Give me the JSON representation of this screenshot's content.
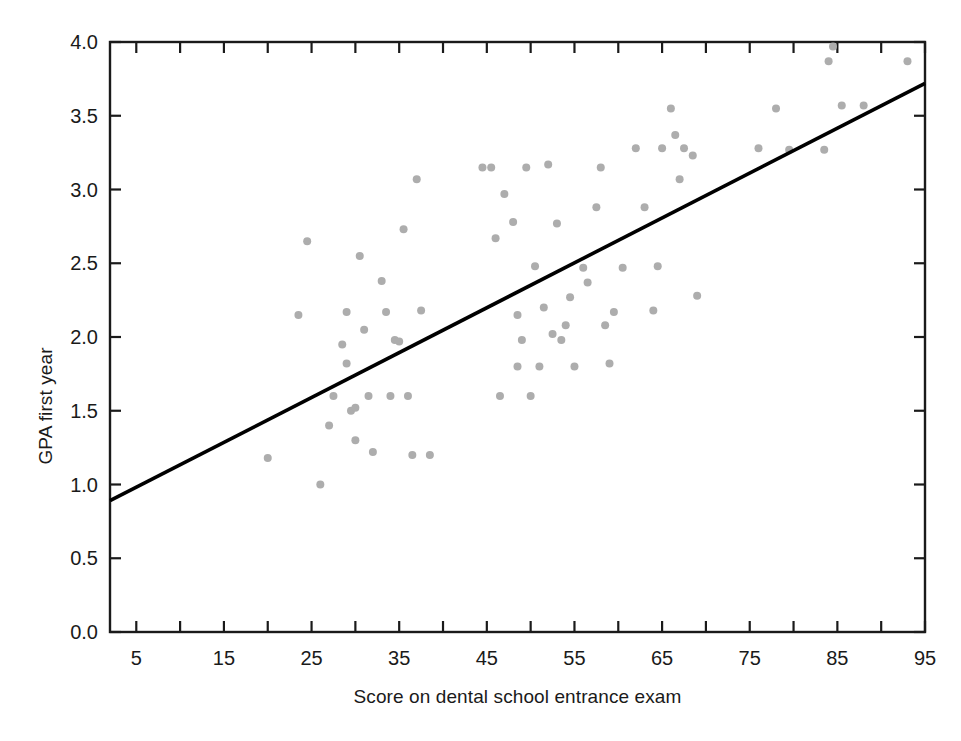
{
  "chart_data": {
    "type": "scatter",
    "title": "",
    "xlabel": "Score on dental school entrance exam",
    "ylabel": "GPA first year",
    "xlim": [
      2,
      95
    ],
    "ylim": [
      0.0,
      4.0
    ],
    "grid": false,
    "legend": "none",
    "point_color": "#adadad",
    "line_color": "#000000",
    "axis_color": "#1a1a1a",
    "xticks_major": [
      5,
      15,
      25,
      35,
      45,
      55,
      65,
      75,
      85,
      95
    ],
    "xticks_minor": [
      10,
      20,
      30,
      40,
      50,
      60,
      70,
      80,
      90
    ],
    "xtick_labels": [
      "5",
      "15",
      "25",
      "35",
      "45",
      "55",
      "65",
      "75",
      "85",
      "95"
    ],
    "yticks": [
      0.0,
      0.5,
      1.0,
      1.5,
      2.0,
      2.5,
      3.0,
      3.5,
      4.0
    ],
    "ytick_labels": [
      "0.0",
      "0.5",
      "1.0",
      "1.5",
      "2.0",
      "2.5",
      "3.0",
      "3.5",
      "4.0"
    ],
    "regression_line": {
      "x_start": 2,
      "y_start": 0.89,
      "x_end": 95,
      "y_end": 3.72
    },
    "points": [
      [
        20.0,
        1.18
      ],
      [
        23.5,
        2.15
      ],
      [
        24.5,
        2.65
      ],
      [
        26.0,
        1.0
      ],
      [
        27.0,
        1.4
      ],
      [
        27.5,
        1.6
      ],
      [
        28.5,
        1.95
      ],
      [
        29.0,
        2.17
      ],
      [
        29.0,
        1.82
      ],
      [
        29.5,
        1.5
      ],
      [
        30.0,
        1.52
      ],
      [
        30.0,
        1.3
      ],
      [
        30.5,
        2.55
      ],
      [
        31.0,
        2.05
      ],
      [
        31.5,
        1.6
      ],
      [
        32.0,
        1.22
      ],
      [
        33.0,
        2.38
      ],
      [
        33.5,
        2.17
      ],
      [
        34.0,
        1.6
      ],
      [
        34.5,
        1.98
      ],
      [
        35.0,
        1.97
      ],
      [
        35.5,
        2.73
      ],
      [
        36.0,
        1.6
      ],
      [
        36.5,
        1.2
      ],
      [
        37.0,
        3.07
      ],
      [
        37.5,
        2.18
      ],
      [
        38.5,
        1.2
      ],
      [
        44.5,
        3.15
      ],
      [
        45.5,
        3.15
      ],
      [
        46.0,
        2.67
      ],
      [
        46.5,
        1.6
      ],
      [
        47.0,
        2.97
      ],
      [
        48.0,
        2.78
      ],
      [
        48.5,
        2.15
      ],
      [
        48.5,
        1.8
      ],
      [
        49.0,
        1.98
      ],
      [
        49.5,
        3.15
      ],
      [
        50.0,
        1.6
      ],
      [
        50.5,
        2.48
      ],
      [
        51.0,
        1.8
      ],
      [
        51.5,
        2.2
      ],
      [
        52.0,
        3.17
      ],
      [
        52.5,
        2.02
      ],
      [
        53.0,
        2.77
      ],
      [
        53.5,
        1.98
      ],
      [
        54.0,
        2.08
      ],
      [
        54.5,
        2.27
      ],
      [
        55.0,
        1.8
      ],
      [
        56.0,
        2.47
      ],
      [
        56.5,
        2.37
      ],
      [
        57.5,
        2.88
      ],
      [
        58.0,
        3.15
      ],
      [
        58.5,
        2.08
      ],
      [
        59.0,
        1.82
      ],
      [
        59.5,
        2.17
      ],
      [
        60.5,
        2.47
      ],
      [
        62.0,
        3.28
      ],
      [
        63.0,
        2.88
      ],
      [
        64.0,
        2.18
      ],
      [
        64.5,
        2.48
      ],
      [
        65.0,
        3.28
      ],
      [
        66.0,
        3.55
      ],
      [
        66.5,
        3.37
      ],
      [
        67.0,
        3.07
      ],
      [
        67.5,
        3.28
      ],
      [
        68.5,
        3.23
      ],
      [
        69.0,
        2.28
      ],
      [
        76.0,
        3.28
      ],
      [
        78.0,
        3.55
      ],
      [
        79.5,
        3.27
      ],
      [
        83.5,
        3.27
      ],
      [
        84.0,
        3.87
      ],
      [
        84.5,
        3.97
      ],
      [
        85.5,
        3.57
      ],
      [
        88.0,
        3.57
      ],
      [
        93.0,
        3.87
      ]
    ]
  },
  "figure": {
    "background": "#ffffff"
  }
}
